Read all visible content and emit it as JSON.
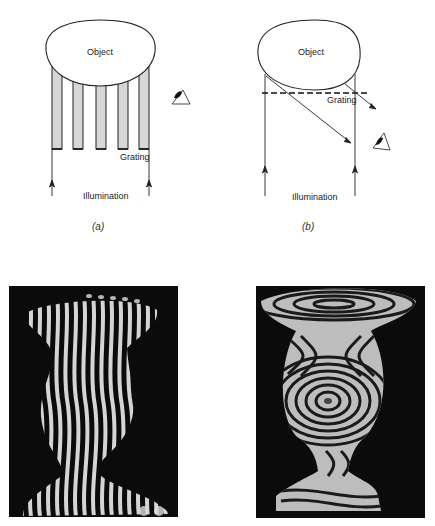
{
  "figure": {
    "panel_a": {
      "caption": "(a)",
      "object_label": "Object",
      "grating_label": "Grating",
      "illumination_label": "Illumination",
      "grating_bars": 5,
      "viewer_icon": "eye-icon"
    },
    "panel_b": {
      "caption": "(b)",
      "object_label": "Object",
      "grating_label": "Grating",
      "illumination_label": "Illumination",
      "grating_style": "dashed-line",
      "viewer_icon": "eye-icon"
    },
    "photos": [
      {
        "name": "vase-photo-straight-fringes",
        "description": "Vase with projected straight-line fringe pattern"
      },
      {
        "name": "vase-photo-contour-fringes",
        "description": "Vase with moiré contour fringes"
      }
    ],
    "colors": {
      "line": "#222222",
      "bar_fill": "#d6d6d6",
      "photo_bg": "#0b0b0b",
      "fringe": "#e8e8e8"
    }
  }
}
